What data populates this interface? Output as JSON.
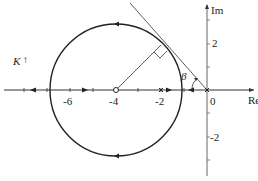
{
  "diagram": {
    "type": "root-locus",
    "axes": {
      "x_label": "Re",
      "y_label": "Im",
      "x_tick_labels": [
        "-6",
        "-4",
        "-2",
        "0"
      ],
      "y_tick_labels": [
        "2",
        "-2"
      ]
    },
    "circle": {
      "center": -4,
      "radius_label": "√8"
    },
    "annotations": {
      "gain_label": "K",
      "gain_arrow": "↑",
      "angle_label": "β"
    },
    "markers": {
      "zero": -4,
      "poles": [
        -2,
        0
      ]
    },
    "colors": {
      "stroke": "#222222",
      "axis": "#555555"
    }
  }
}
